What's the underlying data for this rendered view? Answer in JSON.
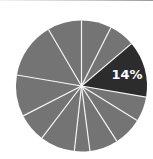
{
  "chart_data": {
    "type": "pie",
    "title": "",
    "start_angle_deg": 0,
    "direction": "clockwise",
    "slices": [
      {
        "value": 7.4,
        "percent_label": "",
        "highlighted": false
      },
      {
        "value": 6.4,
        "percent_label": "",
        "highlighted": false
      },
      {
        "value": 13.9,
        "percent_label": "14%",
        "highlighted": true
      },
      {
        "value": 6.1,
        "percent_label": "",
        "highlighted": false
      },
      {
        "value": 7.1,
        "percent_label": "",
        "highlighted": false
      },
      {
        "value": 7.0,
        "percent_label": "",
        "highlighted": false
      },
      {
        "value": 3.8,
        "percent_label": "",
        "highlighted": false
      },
      {
        "value": 8.6,
        "percent_label": "",
        "highlighted": false
      },
      {
        "value": 7.1,
        "percent_label": "",
        "highlighted": false
      },
      {
        "value": 10.2,
        "percent_label": "",
        "highlighted": false
      },
      {
        "value": 13.9,
        "percent_label": "",
        "highlighted": false
      },
      {
        "value": 8.4,
        "percent_label": "",
        "highlighted": false
      }
    ],
    "values_rounded": [
      7,
      6,
      14,
      6,
      7,
      7,
      4,
      9,
      7,
      10,
      14,
      9
    ],
    "labels": [
      "",
      "",
      "14%",
      "",
      "",
      "",
      "",
      "",
      "",
      "",
      "",
      ""
    ],
    "legend": null,
    "colors": {
      "default": "#747474",
      "highlight": "#2c2c2c",
      "separator": "#f4f4f4",
      "label_text": "#ffffff"
    }
  },
  "highlight_label": "14%"
}
